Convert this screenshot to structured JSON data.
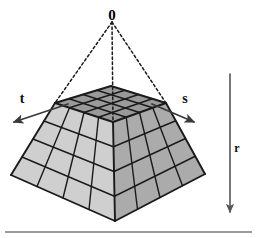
{
  "figure": {
    "name": "pyramid-frustum-coordinate-diagram",
    "background_color": "#ffffff"
  },
  "apex": {
    "label": "0",
    "x": 112,
    "y": 14,
    "font_size": 15
  },
  "axes": [
    {
      "id": "t",
      "label": "t",
      "label_x": 22,
      "label_y": 103,
      "direction": "down-left",
      "start_x": 68,
      "start_y": 104,
      "end_x": 14,
      "end_y": 122,
      "color": "#3a3a3a"
    },
    {
      "id": "s",
      "label": "s",
      "label_x": 185,
      "label_y": 103,
      "direction": "down-right",
      "start_x": 152,
      "start_y": 104,
      "end_x": 194,
      "end_y": 122,
      "color": "#3a3a3a"
    },
    {
      "id": "r",
      "label": "r",
      "label_x": 237,
      "label_y": 152,
      "direction": "down",
      "start_x": 230,
      "start_y": 74,
      "end_x": 230,
      "end_y": 212,
      "color": "#555555"
    }
  ],
  "dashed_rays": {
    "color": "#1a1a1a",
    "dash_pattern": "2.5 2.5",
    "targets": [
      {
        "name": "ray-to-left-corner",
        "x": 55,
        "y": 103
      },
      {
        "name": "ray-to-center-front",
        "x": 113,
        "y": 122
      },
      {
        "name": "ray-to-right-corner",
        "x": 166,
        "y": 103
      }
    ]
  },
  "frustum": {
    "grid_divisions": 4,
    "edge_color": "#1a1a1a",
    "top_face_color": "#9a9a9a",
    "left_face_color": "#cfcfcf",
    "right_face_color": "#ababab",
    "vertices": {
      "top_back": {
        "x": 111,
        "y": 86
      },
      "top_left": {
        "x": 55,
        "y": 103
      },
      "top_front": {
        "x": 113,
        "y": 122
      },
      "top_right": {
        "x": 166,
        "y": 103
      },
      "base_left": {
        "x": 11,
        "y": 175
      },
      "base_front": {
        "x": 115,
        "y": 221
      },
      "base_right": {
        "x": 205,
        "y": 174
      }
    }
  },
  "baseline": {
    "name": "ground-line",
    "x1": 5,
    "y1": 232,
    "x2": 252,
    "y2": 232,
    "color": "#9b9b9b",
    "width": 2
  }
}
